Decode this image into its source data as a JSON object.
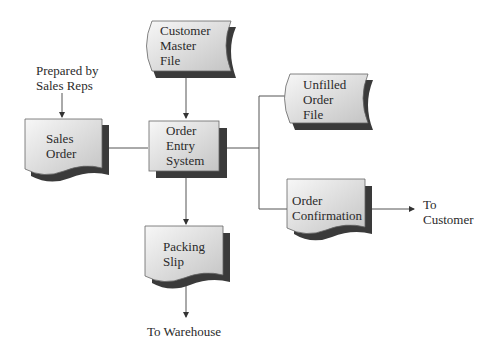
{
  "diagram": {
    "type": "system-flowchart",
    "nodes": [
      {
        "id": "customer_master_file",
        "shape": "stored-data",
        "label": "Customer\nMaster\nFile"
      },
      {
        "id": "sales_order",
        "shape": "document",
        "label": "Sales\nOrder"
      },
      {
        "id": "order_entry_system",
        "shape": "process",
        "label": "Order\nEntry\nSystem"
      },
      {
        "id": "unfilled_order_file",
        "shape": "stored-data",
        "label": "Unfilled\nOrder\nFile"
      },
      {
        "id": "order_confirmation",
        "shape": "document",
        "label": "Order\nConfirmation"
      },
      {
        "id": "packing_slip",
        "shape": "document",
        "label": "Packing\nSlip"
      }
    ],
    "annotations": {
      "prepared_by": "Prepared by\nSales Reps",
      "to_customer": "To\nCustomer",
      "to_warehouse": "To Warehouse"
    },
    "edges": [
      {
        "from": "prepared_by",
        "to": "sales_order",
        "arrow": true
      },
      {
        "from": "customer_master_file",
        "to": "order_entry_system",
        "arrow": true
      },
      {
        "from": "sales_order",
        "to": "order_entry_system",
        "arrow": false
      },
      {
        "from": "order_entry_system",
        "to": "unfilled_order_file",
        "arrow": false
      },
      {
        "from": "order_entry_system",
        "to": "order_confirmation",
        "arrow": false
      },
      {
        "from": "order_entry_system",
        "to": "packing_slip",
        "arrow": true
      },
      {
        "from": "order_confirmation",
        "to": "to_customer",
        "arrow": true
      },
      {
        "from": "packing_slip",
        "to": "to_warehouse",
        "arrow": true
      }
    ],
    "colors": {
      "fill_light": "#f4f4f4",
      "fill_dark": "#c9c9c9",
      "shadow": "#3a3a3a",
      "line": "#555555"
    }
  }
}
